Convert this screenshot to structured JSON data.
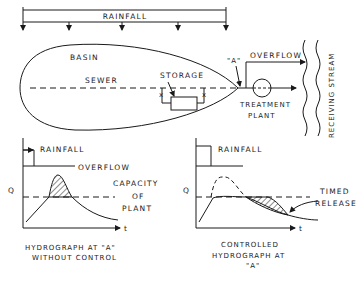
{
  "diagram": {
    "top": {
      "rainfall_label": "RAINFALL",
      "basin_label": "BASIN",
      "sewer_label": "SEWER",
      "storage_label": "STORAGE",
      "point_label": "\"A\"",
      "overflow_label": "OVERFLOW",
      "treatment_label_1": "TREATMENT",
      "treatment_label_2": "PLANT",
      "stream_label": "RECEIVING STREAM",
      "valve_mark": "x"
    },
    "left_graph": {
      "y_axis": "Q",
      "x_axis": "t",
      "rainfall_label": "RAINFALL",
      "overflow_label": "OVERFLOW",
      "capacity_1": "CAPACITY",
      "capacity_2": "OF",
      "capacity_3": "PLANT",
      "caption_1": "HYDROGRAPH AT \"A\"",
      "caption_2": "WITHOUT CONTROL"
    },
    "right_graph": {
      "y_axis": "Q",
      "x_axis": "t",
      "rainfall_label": "RAINFALL",
      "timed_1": "TIMED",
      "timed_2": "RELEASE",
      "caption_1": "CONTROLLED",
      "caption_2": "HYDROGRAPH AT",
      "caption_3": "\"A\""
    }
  }
}
